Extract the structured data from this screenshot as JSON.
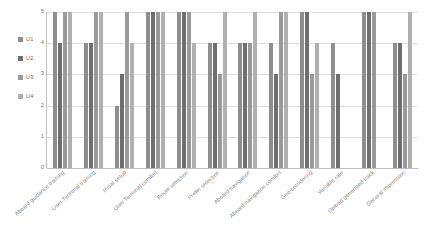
{
  "chart_data": {
    "type": "bar",
    "title": "",
    "xlabel": "",
    "ylabel": "",
    "ylim": [
      0,
      5
    ],
    "yticks": [
      "0",
      "1",
      "2",
      "3",
      "4",
      "5"
    ],
    "grid": true,
    "legend_position": "left",
    "orientation": "vertical",
    "grouping": "clustered",
    "categories": [
      "Aboard guidance training",
      "User Terminal training",
      "Initial setup",
      "User Terminal comfort",
      "Route selection",
      "Prefer selection",
      "Aboard navigation",
      "Aboard navigation comfort",
      "Geo-corridoring",
      "Variable rate",
      "Upload generated track",
      "General impression"
    ],
    "series": [
      {
        "name": "U1",
        "color": "#8e8e8e",
        "values": [
          5,
          4,
          2,
          5,
          5,
          4,
          4,
          4,
          5,
          4,
          5,
          4
        ]
      },
      {
        "name": "U2",
        "color": "#6f6f6f",
        "values": [
          4,
          4,
          3,
          5,
          5,
          4,
          4,
          3,
          5,
          3,
          5,
          4
        ]
      },
      {
        "name": "U3",
        "color": "#9a9a9a",
        "values": [
          5,
          5,
          5,
          5,
          5,
          3,
          4,
          5,
          3,
          0,
          5,
          3
        ]
      },
      {
        "name": "U4",
        "color": "#b0b0b0",
        "values": [
          5,
          5,
          4,
          5,
          4,
          5,
          5,
          5,
          4,
          0,
          0,
          5
        ]
      }
    ]
  },
  "colors": {
    "gridline": "#e2e2e2",
    "axis": "#bdbdbd",
    "tick_text": "#7a7a7a",
    "category_text": "#8a8a8a",
    "legend_text": "#6d6d6d",
    "background": "#ffffff"
  }
}
